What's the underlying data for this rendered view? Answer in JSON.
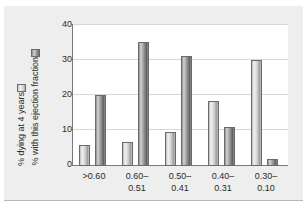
{
  "chart_data": {
    "type": "bar",
    "title": "",
    "xlabel": "",
    "ylabel": "",
    "ylim": [
      0,
      40
    ],
    "yticks": [
      "0",
      "10",
      "20",
      "30",
      "40"
    ],
    "ytick_values": [
      0,
      10,
      20,
      30,
      40
    ],
    "grid": true,
    "legend_position": "left-outside-vertical",
    "categories": [
      ">0.60",
      "0.60–\n0.51",
      "0.50–\n0.41",
      "0.40–\n0.31",
      "0.30–\n0.10"
    ],
    "category_lines": [
      [
        ">0.60",
        ""
      ],
      [
        "0.60–",
        "0.51"
      ],
      [
        "0.50–",
        "0.41"
      ],
      [
        "0.40–",
        "0.31"
      ],
      [
        "0.30–",
        "0.10"
      ]
    ],
    "series": [
      {
        "name": "% dying at 4 years",
        "color": "#d4d4d4",
        "values": [
          6.0,
          6.7,
          9.7,
          18.3,
          29.8
        ]
      },
      {
        "name": "% with this ejection fraction",
        "color": "#8f8f8f",
        "values": [
          20.0,
          35.0,
          31.0,
          11.0,
          2.0
        ]
      }
    ]
  },
  "legend": {
    "entries": [
      {
        "label": "% dying at 4 years",
        "swatch": "light-gray-swatch-icon"
      },
      {
        "label": "% with this ejection fraction",
        "swatch": "dark-gray-swatch-icon"
      }
    ]
  },
  "axes": {
    "y": {
      "ticks": [
        "0",
        "10",
        "20",
        "30",
        "40"
      ]
    },
    "x": {
      "labels": [
        {
          "line1": ">0.60",
          "line2": ""
        },
        {
          "line1": "0.60–",
          "line2": "0.51"
        },
        {
          "line1": "0.50–",
          "line2": "0.41"
        },
        {
          "line1": "0.40–",
          "line2": "0.31"
        },
        {
          "line1": "0.30–",
          "line2": "0.10"
        }
      ]
    }
  },
  "colors": {
    "panel_background": "#eeeeee",
    "plot_background": "#ffffff",
    "axis": "#7a7a7a",
    "gridline": "#d8d8d8",
    "text": "#2b2b2b",
    "series_light": "#d4d4d4",
    "series_dark": "#8f8f8f"
  }
}
